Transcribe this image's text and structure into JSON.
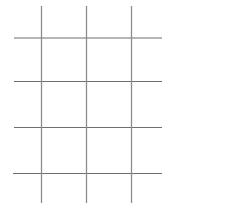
{
  "figure": {
    "background_color": "#ffffff",
    "width": 236,
    "height": 209
  },
  "chart_data": {
    "type": "diagram",
    "subtype": "line-lattice",
    "grid": true,
    "legend": null,
    "xlabel": "",
    "ylabel": "",
    "xlim": [
      0,
      236
    ],
    "ylim": [
      0,
      209
    ],
    "vertical_lines": [
      {
        "id": "v1",
        "x": 41.5,
        "y_start": 6,
        "y_end": 203,
        "color": "#8d8d8d",
        "width": 1.3
      },
      {
        "id": "v2",
        "x": 86.5,
        "y_start": 6,
        "y_end": 203,
        "color": "#8d8d8d",
        "width": 1.3
      },
      {
        "id": "v3",
        "x": 131.5,
        "y_start": 6,
        "y_end": 203,
        "color": "#8d8d8d",
        "width": 1.3
      }
    ],
    "horizontal_lines": [
      {
        "id": "h1",
        "y": 38.0,
        "x_start": 14,
        "x_end": 162,
        "color": "#6f6f6f",
        "width": 1.2
      },
      {
        "id": "h2",
        "y": 81.5,
        "x_start": 14,
        "x_end": 162,
        "color": "#6f6f6f",
        "width": 1.2
      },
      {
        "id": "h3",
        "y": 127.5,
        "x_start": 14,
        "x_end": 162,
        "color": "#6f6f6f",
        "width": 1.2
      },
      {
        "id": "h4",
        "y": 173.5,
        "x_start": 13,
        "x_end": 162,
        "color": "#6f6f6f",
        "width": 1.2
      }
    ],
    "counts": {
      "vertical": 3,
      "horizontal": 4,
      "intersections": 12,
      "enclosed_cells": 6
    },
    "colors": {
      "background": "#ffffff",
      "vertical_stroke": "#8d8d8d",
      "horizontal_stroke": "#6f6f6f"
    }
  },
  "labels": {
    "none_visible": ""
  }
}
